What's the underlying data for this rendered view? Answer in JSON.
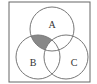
{
  "diagram": {
    "type": "venn",
    "universe": {
      "x": 9,
      "y": 2,
      "width": 81,
      "height": 80,
      "stroke": "#666666"
    },
    "circles": [
      {
        "id": "A",
        "label": "A",
        "cx": 52,
        "cy": 29,
        "r": 22,
        "label_x": 52,
        "label_y": 25
      },
      {
        "id": "B",
        "label": "B",
        "cx": 38,
        "cy": 57,
        "r": 22,
        "label_x": 33,
        "label_y": 66
      },
      {
        "id": "C",
        "label": "C",
        "cx": 66,
        "cy": 57,
        "r": 22,
        "label_x": 74,
        "label_y": 66
      }
    ],
    "shaded_region": "A ∩ B ∩ C'",
    "shade_color": "#888888",
    "stroke_color": "#777777"
  }
}
